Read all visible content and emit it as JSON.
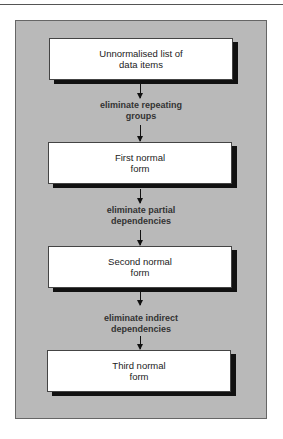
{
  "diagram": {
    "boxes": [
      {
        "label": "Unnormalised list of data items"
      },
      {
        "label": "First normal form"
      },
      {
        "label": "Second normal form"
      },
      {
        "label": "Third normal form"
      }
    ],
    "transitions": [
      {
        "label": "eliminate repeating groups"
      },
      {
        "label": "eliminate partial dependencies"
      },
      {
        "label": "eliminate indirect dependencies"
      }
    ]
  }
}
